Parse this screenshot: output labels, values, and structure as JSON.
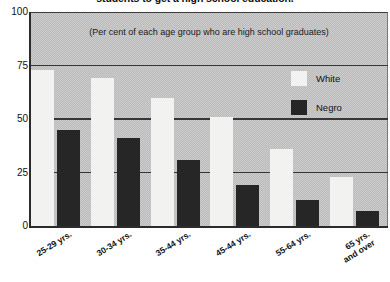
{
  "chart_data": {
    "type": "bar",
    "title": "students to get a high school education.",
    "subtitle": "(Per cent of each age group who are high school graduates)",
    "xlabel": "",
    "ylabel": "",
    "ylim": [
      0,
      100
    ],
    "yticks": [
      0,
      25,
      50,
      75,
      100
    ],
    "grid": true,
    "legend_position": "inside-right",
    "categories": [
      "25-29 yrs.",
      "30-34 yrs.",
      "35-44 yrs.",
      "45-44 yrs.",
      "55-64 yrs.",
      "65 yrs.\nand over"
    ],
    "series": [
      {
        "name": "White",
        "color": "#f2f2f0",
        "values": [
          73,
          69,
          60,
          51,
          36,
          23
        ]
      },
      {
        "name": "Negro",
        "color": "#262626",
        "values": [
          45,
          41,
          31,
          19,
          12,
          7
        ]
      }
    ]
  },
  "legend": {
    "items": [
      {
        "label": "White"
      },
      {
        "label": "Negro"
      }
    ]
  }
}
